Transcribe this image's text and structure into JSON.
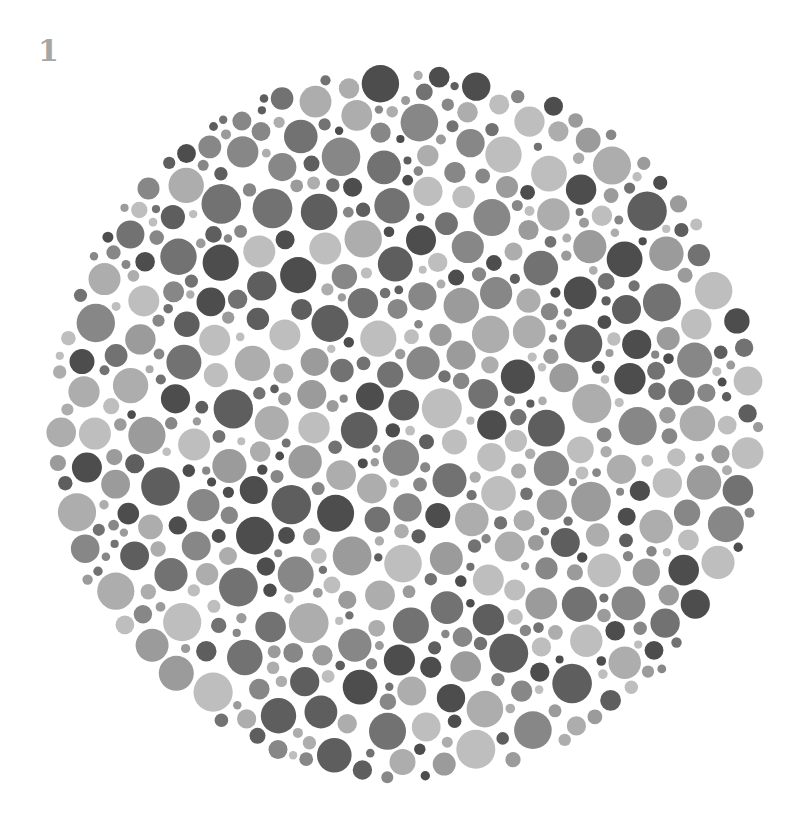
{
  "plate": {
    "label": "1",
    "center": [
      406,
      424
    ],
    "radius": 360,
    "background": "#ffffff",
    "dot_palette": [
      "#4d4d4d",
      "#5e5e5e",
      "#727272",
      "#878787",
      "#9b9b9b",
      "#adadad",
      "#bebebe"
    ],
    "dot_radius_range": [
      4,
      20
    ],
    "seed": 1234,
    "description": "Grayscale Ishihara-style color vision test plate composed of dots of varying sizes and gray tones"
  }
}
